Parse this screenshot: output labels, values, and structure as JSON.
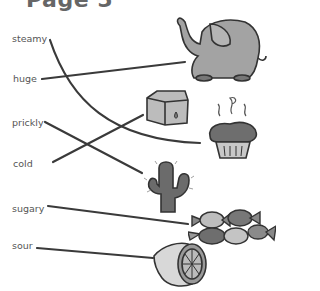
{
  "title": "Page 5",
  "words": [
    {
      "id": "steamy",
      "label": "steamy",
      "x": 12,
      "y": 33
    },
    {
      "id": "huge",
      "label": "huge",
      "x": 13,
      "y": 73
    },
    {
      "id": "prickly",
      "label": "prickly",
      "x": 12,
      "y": 117
    },
    {
      "id": "cold",
      "label": "cold",
      "x": 13,
      "y": 158
    },
    {
      "id": "sugary",
      "label": "sugary",
      "x": 12,
      "y": 203
    },
    {
      "id": "sour",
      "label": "sour",
      "x": 12,
      "y": 240
    }
  ],
  "pictures": [
    "elephant",
    "ice-cube",
    "muffin",
    "cactus",
    "candies",
    "lemon"
  ],
  "matches": [
    {
      "word": "steamy",
      "picture": "muffin"
    },
    {
      "word": "huge",
      "picture": "elephant"
    },
    {
      "word": "prickly",
      "picture": "cactus"
    },
    {
      "word": "cold",
      "picture": "ice-cube"
    },
    {
      "word": "sugary",
      "picture": "candies"
    },
    {
      "word": "sour",
      "picture": "lemon"
    }
  ],
  "colors": {
    "line": "#3a3a3a",
    "text": "#555555",
    "fill": "#9a9a9a",
    "outline": "#333333"
  }
}
